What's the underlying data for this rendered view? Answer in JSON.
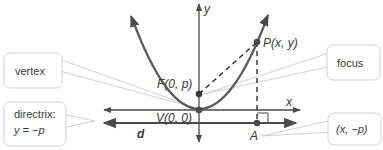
{
  "diagram": {
    "colors": {
      "curve": "#5a5a5a",
      "axis": "#4a4a4a",
      "callout_border": "#cfcfcf",
      "callout_fill": "#ffffff",
      "text": "#3a3a3a"
    },
    "axes": {
      "x_label": "x",
      "y_label": "y"
    },
    "points": {
      "focus": "F(0, p)",
      "vertex": "V(0, 0)",
      "point": "P(x, y)",
      "a": "A"
    },
    "line_labels": {
      "directrix_line": "d"
    },
    "callouts": {
      "vertex": "vertex",
      "directrix_line1": "directrix:",
      "directrix_line2": "y = −p",
      "focus": "focus",
      "a_coord": "(x, −p)"
    }
  }
}
